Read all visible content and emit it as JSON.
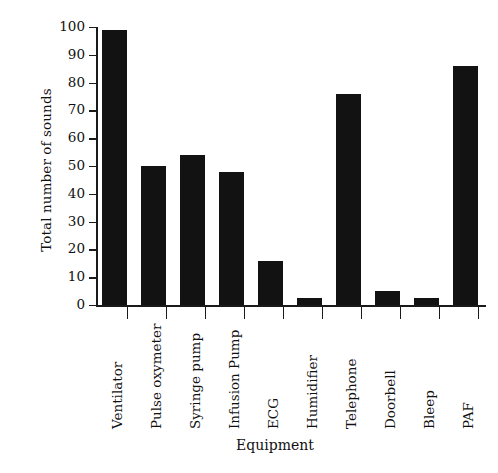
{
  "chart_data": {
    "type": "bar",
    "title": "",
    "xlabel": "Equipment",
    "ylabel": "Total number of sounds",
    "categories": [
      "Ventilator",
      "Pulse oxymeter",
      "Syringe pump",
      "Infusion Pump",
      "ECG",
      "Humidifier",
      "Telephone",
      "Doorbell",
      "Bleep",
      "PAF"
    ],
    "values": [
      99,
      50,
      54,
      48,
      16,
      2.5,
      76,
      5,
      2.5,
      86
    ],
    "ylim": [
      0,
      100
    ],
    "yticks": [
      0,
      10,
      20,
      30,
      40,
      50,
      60,
      70,
      80,
      90,
      100
    ],
    "ytick_labels": [
      "0",
      "10",
      "20",
      "30",
      "40",
      "50",
      "60",
      "70",
      "80",
      "90",
      "100"
    ],
    "grid": false,
    "legend": false,
    "bar_color": "#121212",
    "axis_color": "#1a1a1a",
    "background": "#ffffff"
  }
}
